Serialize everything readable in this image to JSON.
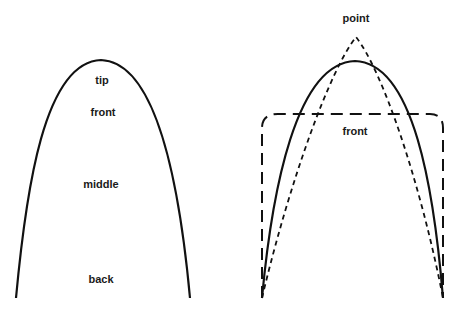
{
  "left_panel": {
    "shape": "parabolic-arch",
    "labels": [
      {
        "text": "tip",
        "x": 102,
        "y": 75
      },
      {
        "text": "front",
        "x": 103,
        "y": 107
      },
      {
        "text": "middle",
        "x": 101,
        "y": 179
      },
      {
        "text": "back",
        "x": 101,
        "y": 274
      }
    ]
  },
  "right_panel": {
    "labels": [
      {
        "text": "point",
        "x": 356,
        "y": 13
      },
      {
        "text": "front",
        "x": 355,
        "y": 126
      }
    ],
    "curves": [
      {
        "name": "solid-parabola",
        "style": "solid"
      },
      {
        "name": "pointed-curve",
        "style": "short-dash"
      },
      {
        "name": "rounded-box",
        "style": "long-dash"
      }
    ]
  },
  "colors": {
    "stroke": "#111111",
    "background": "#ffffff"
  }
}
